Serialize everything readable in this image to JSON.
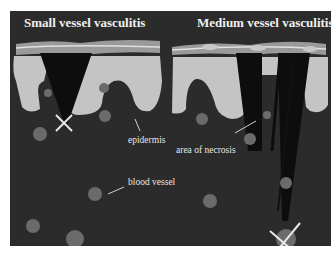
{
  "figure": {
    "titles": {
      "left": "Small vessel vasculitis",
      "right": "Medium vessel vasculitis"
    },
    "labels": {
      "epidermis": "epidermis",
      "necrosis": "area of necrosis",
      "blood_vessel": "blood vessel"
    },
    "colors": {
      "background": "#2b2b2b",
      "epidermis": "#c4c4c4",
      "vessel": "#6b6b6b",
      "necrosis": "#0d0d0d",
      "marker": "#e8e8e8"
    }
  }
}
